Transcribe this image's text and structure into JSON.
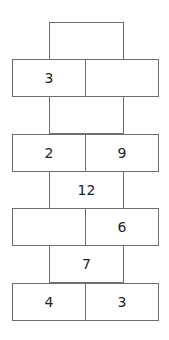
{
  "diagram": {
    "type": "number-wall",
    "rows": [
      {
        "kind": "narrow",
        "top": 22,
        "cells": [
          ""
        ]
      },
      {
        "kind": "wide",
        "top": 59,
        "cells": [
          "3",
          ""
        ]
      },
      {
        "kind": "narrow",
        "top": 96,
        "cells": [
          ""
        ]
      },
      {
        "kind": "wide",
        "top": 134,
        "cells": [
          "2",
          "9"
        ]
      },
      {
        "kind": "narrow",
        "top": 171,
        "cells": [
          "12"
        ]
      },
      {
        "kind": "wide",
        "top": 208,
        "cells": [
          "",
          "6"
        ]
      },
      {
        "kind": "narrow",
        "top": 245,
        "cells": [
          "7"
        ]
      },
      {
        "kind": "wide",
        "top": 283,
        "cells": [
          "4",
          "3"
        ]
      }
    ]
  }
}
